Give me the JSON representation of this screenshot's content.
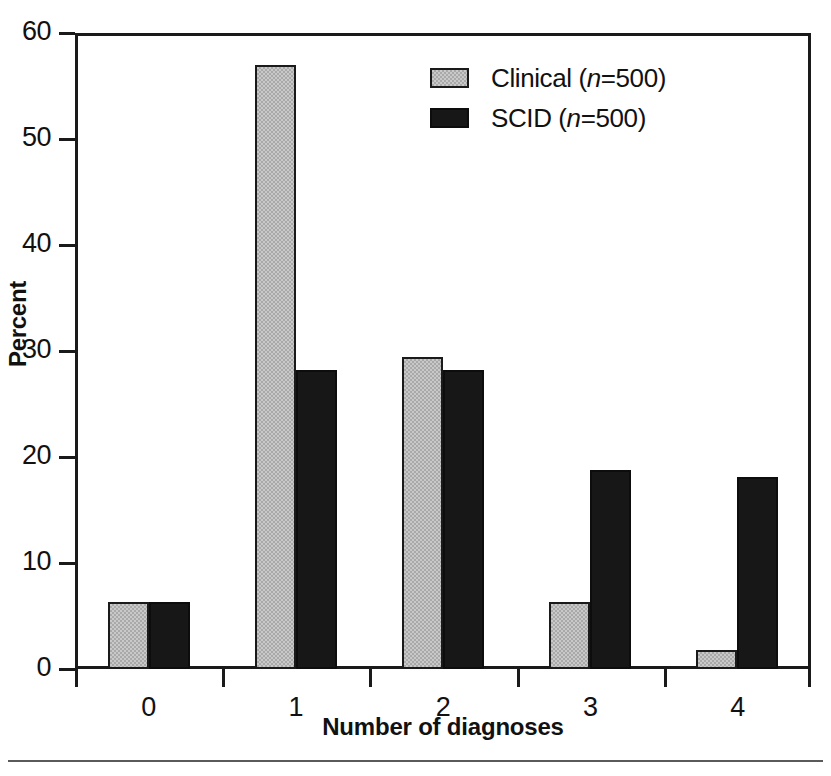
{
  "chart_data": {
    "type": "bar",
    "title": "",
    "subtitle": "",
    "xlabel": "Number of diagnoses",
    "ylabel": "Percent",
    "categories": [
      "0",
      "1",
      "2",
      "3",
      "4"
    ],
    "series": [
      {
        "name": "Clinical (n=500)",
        "legend_text": "Clinical (",
        "legend_italic": "n",
        "legend_tail": "=500)",
        "color": "#c9c9c9",
        "values": [
          6.3,
          57.0,
          29.4,
          6.3,
          1.8
        ]
      },
      {
        "name": "SCID (n=500)",
        "legend_text": "SCID (",
        "legend_italic": "n",
        "legend_tail": "=500)",
        "color": "#171717",
        "values": [
          6.3,
          28.2,
          28.2,
          18.8,
          18.1
        ]
      }
    ],
    "ylim": [
      0,
      60
    ],
    "yticks": [
      0,
      10,
      20,
      30,
      40,
      50,
      60
    ],
    "ytick_labels": [
      "0",
      "10",
      "20",
      "30",
      "40",
      "50",
      "60"
    ],
    "xtick_boundaries": [
      0,
      1,
      2,
      3,
      4,
      5
    ],
    "grid": false,
    "legend_position": "top-center-right",
    "frame": true
  },
  "axes": {
    "y_title": "Percent",
    "x_title": "Number of diagnoses"
  },
  "legend": {
    "items": [
      {
        "label": "Clinical (n=500)",
        "swatch": "clinical-swatch"
      },
      {
        "label": "SCID (n=500)",
        "swatch": "scid-swatch"
      }
    ]
  },
  "colors": {
    "clinical_fill": "#c9c9c9",
    "scid_fill": "#171717",
    "axis": "#1a1a1a",
    "text": "#111111",
    "rule": "#5a5a5a",
    "background": "#ffffff"
  }
}
